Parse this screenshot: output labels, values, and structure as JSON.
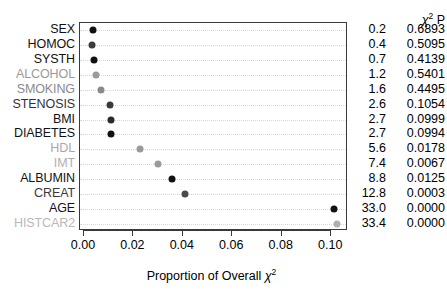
{
  "chart_data": {
    "type": "scatter",
    "title": "",
    "xlabel": "Proportion of Overall χ²",
    "ylabel": "",
    "xlim": [
      -0.0016,
      0.1068
    ],
    "xticks": [
      0.0,
      0.02,
      0.04,
      0.06,
      0.08,
      0.1
    ],
    "xticklabels": [
      "0.00",
      "0.02",
      "0.04",
      "0.06",
      "0.08",
      "0.10"
    ],
    "grid": "horizontal-dotted",
    "legend": "none",
    "categories": [
      "SEX",
      "HOMOC",
      "SYSTH",
      "ALCOHOL",
      "SMOKING",
      "STENOSIS",
      "BMI",
      "DIABETES",
      "HDL",
      "IMT",
      "ALBUMIN",
      "CREAT",
      "AGE",
      "HISTCAR2"
    ],
    "values": [
      0.0036,
      0.0031,
      0.004,
      0.0049,
      0.007,
      0.0105,
      0.0108,
      0.0109,
      0.0228,
      0.03,
      0.0357,
      0.041,
      0.1012,
      0.1025
    ],
    "point_shades": [
      "#111111",
      "#3d3d3d",
      "#111111",
      "#9a9a9a",
      "#8a8a8a",
      "#3a3a3a",
      "#2a2a2a",
      "#111111",
      "#9a9a9a",
      "#9a9a9a",
      "#111111",
      "#4a4a4a",
      "#111111",
      "#b0b0b0"
    ],
    "label_shades": [
      "#111111",
      "#111111",
      "#111111",
      "#9a9a9a",
      "#8a8a8a",
      "#333333",
      "#111111",
      "#111111",
      "#a8a8a8",
      "#b0b0b0",
      "#111111",
      "#3a3a3a",
      "#111111",
      "#b8b8b8"
    ],
    "annotation_columns": {
      "chi_header": "χ",
      "chi_header_sup": "2",
      "p_header": "P",
      "chi_values": [
        "0.2",
        "0.4",
        "0.7",
        "1.2",
        "1.6",
        "2.6",
        "2.7",
        "2.7",
        "5.6",
        "7.4",
        "8.8",
        "12.8",
        "33.0",
        "33.4"
      ],
      "p_values": [
        "0.6893",
        "0.5095",
        "0.4139",
        "0.5401",
        "0.4495",
        "0.1054",
        "0.0999",
        "0.0994",
        "0.0178",
        "0.0067",
        "0.0125",
        "0.0003",
        "0.0000",
        "0.0000"
      ]
    }
  },
  "axis_title": {
    "prefix": "Proportion of Overall ",
    "chi": "χ",
    "sup": "2"
  },
  "colors": {
    "frame": "#3a3a3a",
    "grid": "#d8d8d8",
    "background": "#ffffff",
    "text": "#000000"
  }
}
